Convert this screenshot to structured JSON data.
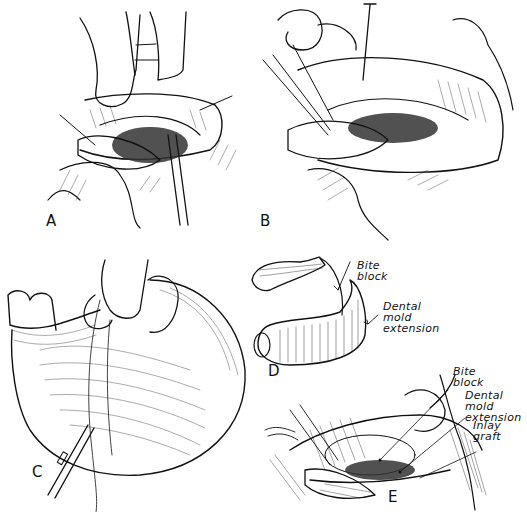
{
  "figure": {
    "panels": [
      {
        "id": "A",
        "label": "A"
      },
      {
        "id": "B",
        "label": "B"
      },
      {
        "id": "C",
        "label": "C"
      },
      {
        "id": "D",
        "label": "D",
        "annotations": [
          "Bite\nblock",
          "Dental\nmold\nextension"
        ]
      },
      {
        "id": "E",
        "label": "E",
        "annotations": [
          "Bite\nblock",
          "Dental\nmold\nextension",
          "Inlay\ngraft"
        ]
      }
    ],
    "colors": {
      "ink": "#111111",
      "background": "#ffffff",
      "shade": "#333333"
    }
  }
}
